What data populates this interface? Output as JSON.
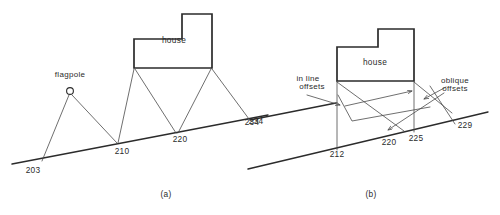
{
  "figure": {
    "panels": [
      {
        "caption": "(a)",
        "caption_x": 166,
        "caption_y": 197,
        "house_label": "house",
        "house_label_x": 174,
        "house_label_y": 43,
        "flagpole_label": "flagpole",
        "flagpole_label_x": 70,
        "flagpole_label_y": 77,
        "stations": [
          {
            "label": "203",
            "x": 33,
            "y": 173
          },
          {
            "label": "210",
            "x": 122,
            "y": 154
          },
          {
            "label": "220",
            "x": 180,
            "y": 142
          },
          {
            "label": "234",
            "x": 252,
            "y": 125
          }
        ]
      },
      {
        "caption": "(b)",
        "caption_x": 371,
        "caption_y": 197,
        "house_label": "house",
        "house_label_x": 375,
        "house_label_y": 65,
        "annotations": [
          {
            "label": "in line",
            "x": 308,
            "y": 81
          },
          {
            "label": "offsets",
            "x": 312,
            "y": 89
          },
          {
            "label": "oblique",
            "x": 455,
            "y": 83
          },
          {
            "label": "offsets",
            "x": 455,
            "y": 91
          }
        ],
        "stations": [
          {
            "label": "234",
            "x": 256,
            "y": 124
          },
          {
            "label": "212",
            "x": 337,
            "y": 157
          },
          {
            "label": "220",
            "x": 389,
            "y": 145
          },
          {
            "label": "225",
            "x": 416,
            "y": 141
          },
          {
            "label": "229",
            "x": 465,
            "y": 128
          }
        ]
      }
    ],
    "colors": {
      "ink": "#2b2b2b",
      "thin_ink": "#4a4a4a",
      "paper": "#ffffff"
    }
  }
}
